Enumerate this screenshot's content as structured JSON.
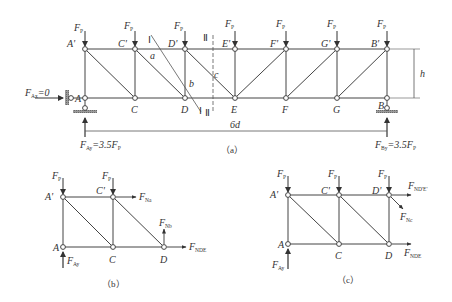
{
  "figure_a": {
    "caption": "（a）",
    "load_label": "F",
    "load_sub": "P",
    "top_nodes": [
      "A'",
      "C'",
      "D'",
      "E'",
      "F'",
      "G'",
      "B'"
    ],
    "bottom_nodes": [
      "A",
      "C",
      "D",
      "E",
      "F",
      "G",
      "B"
    ],
    "span_label": "6d",
    "height_label": "h",
    "horizontal_reaction": {
      "main": "F",
      "sub": "Ax",
      "value": "=0"
    },
    "left_reaction": {
      "main": "F",
      "sub": "Ay",
      "value": "=3.5F",
      "value_sub": "P"
    },
    "right_reaction": {
      "main": "F",
      "sub": "By",
      "value": "=3.5F",
      "value_sub": "P"
    },
    "section_1_label": "Ⅰ",
    "section_2_label": "Ⅱ",
    "member_a": "a",
    "member_b": "b",
    "member_c": "c"
  },
  "figure_b": {
    "caption": "（b）",
    "nodes": [
      "A'",
      "C'",
      "A",
      "C",
      "D"
    ],
    "load_label": "F",
    "load_sub": "P",
    "force_top": {
      "main": "F",
      "sub": "Na"
    },
    "force_vertical": {
      "main": "F",
      "sub": "Nb"
    },
    "force_bottom": {
      "main": "F",
      "sub": "NDE"
    },
    "reaction": {
      "main": "F",
      "sub": "Ay"
    }
  },
  "figure_c": {
    "caption": "（c）",
    "nodes": [
      "A'",
      "C'",
      "D'",
      "A",
      "C",
      "D"
    ],
    "load_label": "F",
    "load_sub": "P",
    "force_top": {
      "main": "F",
      "sub": "ND'E'"
    },
    "force_diag": {
      "main": "F",
      "sub": "Nc"
    },
    "force_bottom": {
      "main": "F",
      "sub": "NDE"
    },
    "reaction": {
      "main": "F",
      "sub": "Ay"
    }
  }
}
